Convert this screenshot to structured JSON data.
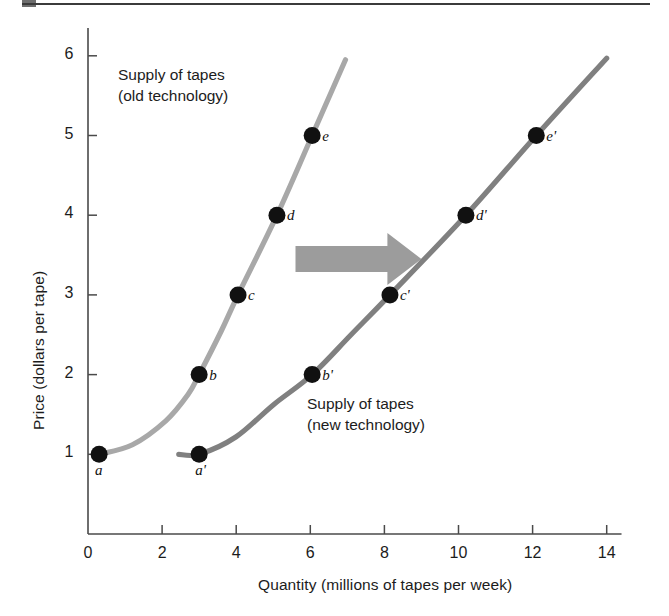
{
  "figure": {
    "background": "#ffffff",
    "rule_color": "#3b3b3b"
  },
  "chart_data": {
    "type": "line",
    "title": "",
    "xlabel": "Quantity (millions of tapes per week)",
    "ylabel": "Price (dollars per tape)",
    "xlim": [
      0,
      14.4
    ],
    "ylim": [
      0,
      6.35
    ],
    "xticks": [
      0,
      2,
      4,
      6,
      8,
      10,
      12,
      14
    ],
    "xtick_labels": [
      "0",
      "2",
      "4",
      "6",
      "8",
      "10",
      "12",
      "14"
    ],
    "yticks": [
      1,
      2,
      3,
      4,
      5,
      6
    ],
    "ytick_labels": [
      "1",
      "2",
      "3",
      "4",
      "5",
      "6"
    ],
    "grid": false,
    "legend_position": "inline-annotations",
    "series": [
      {
        "name": "Supply of tapes (old technology)",
        "color": "#a8a8a8",
        "label_lines": [
          "Supply of tapes",
          "(old technology)"
        ],
        "points": [
          {
            "id": "a",
            "label": "a",
            "x": 0.3,
            "y": 1
          },
          {
            "id": "b",
            "label": "b",
            "x": 3.0,
            "y": 2
          },
          {
            "id": "c",
            "label": "c",
            "x": 4.05,
            "y": 3
          },
          {
            "id": "d",
            "label": "d",
            "x": 5.1,
            "y": 4
          },
          {
            "id": "e",
            "label": "e",
            "x": 6.05,
            "y": 5
          }
        ],
        "path": [
          {
            "x": 0.3,
            "y": 1.0
          },
          {
            "x": 1.2,
            "y": 1.12
          },
          {
            "x": 2.1,
            "y": 1.42
          },
          {
            "x": 2.7,
            "y": 1.75
          },
          {
            "x": 3.0,
            "y": 2.0
          },
          {
            "x": 3.6,
            "y": 2.55
          },
          {
            "x": 4.05,
            "y": 3.0
          },
          {
            "x": 5.1,
            "y": 4.0
          },
          {
            "x": 6.05,
            "y": 5.0
          },
          {
            "x": 6.95,
            "y": 5.95
          }
        ]
      },
      {
        "name": "Supply of tapes (new technology)",
        "color": "#808080",
        "label_lines": [
          "Supply of tapes",
          "(new technology)"
        ],
        "points": [
          {
            "id": "a-prime",
            "label": "a'",
            "x": 3.0,
            "y": 1.0
          },
          {
            "id": "b-prime",
            "label": "b'",
            "x": 6.05,
            "y": 2
          },
          {
            "id": "c-prime",
            "label": "c'",
            "x": 8.15,
            "y": 3
          },
          {
            "id": "d-prime",
            "label": "d'",
            "x": 10.2,
            "y": 4
          },
          {
            "id": "e-prime",
            "label": "e'",
            "x": 12.1,
            "y": 5
          }
        ],
        "path": [
          {
            "x": 2.45,
            "y": 1.0
          },
          {
            "x": 3.0,
            "y": 1.0
          },
          {
            "x": 4.0,
            "y": 1.22
          },
          {
            "x": 5.0,
            "y": 1.62
          },
          {
            "x": 6.05,
            "y": 2.0
          },
          {
            "x": 7.1,
            "y": 2.5
          },
          {
            "x": 8.15,
            "y": 3.0
          },
          {
            "x": 10.2,
            "y": 4.0
          },
          {
            "x": 12.1,
            "y": 5.0
          },
          {
            "x": 14.0,
            "y": 5.97
          }
        ]
      }
    ],
    "annotations": [
      {
        "id": "shift-arrow",
        "type": "arrow",
        "direction": "right",
        "color": "#9c9c9c",
        "x_start": 5.6,
        "x_end": 9.0,
        "y": 3.45
      }
    ]
  }
}
